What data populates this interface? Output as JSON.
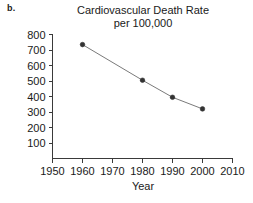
{
  "figure": {
    "panel_label": "b.",
    "title_line_1": "Cardiovascular Death Rate",
    "title_line_2": "per 100,000",
    "axis_title_x": "Year",
    "background_color": "#ffffff",
    "axis_color": "#3a3a3a",
    "line_color": "#7a7a7a",
    "marker_color": "#333333"
  },
  "chart_data": {
    "type": "line",
    "title": "Cardiovascular Death Rate per 100,000",
    "xlabel": "Year",
    "ylabel": "",
    "x": [
      1960,
      1980,
      1990,
      2000
    ],
    "values": [
      735,
      505,
      395,
      320
    ],
    "points": [
      {
        "x": 1960,
        "y": 735
      },
      {
        "x": 1980,
        "y": 505
      },
      {
        "x": 1990,
        "y": 395
      },
      {
        "x": 2000,
        "y": 320
      }
    ],
    "xlim": [
      1950,
      2010
    ],
    "ylim": [
      0,
      800
    ],
    "xticks": [
      1950,
      1960,
      1970,
      1980,
      1990,
      2000,
      2010
    ],
    "yticks": [
      100,
      200,
      300,
      400,
      500,
      600,
      700,
      800
    ],
    "xtick_labels": [
      "1950",
      "1960",
      "1970",
      "1980",
      "1990",
      "2000",
      "2010"
    ],
    "ytick_labels": [
      "100",
      "200",
      "300",
      "400",
      "500",
      "600",
      "700",
      "800"
    ],
    "grid": false,
    "legend": null,
    "marker": "circle"
  }
}
